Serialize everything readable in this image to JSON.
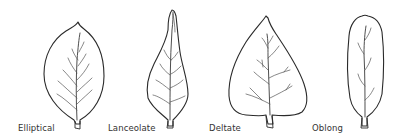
{
  "figure": {
    "leaves": [
      {
        "id": "elliptical",
        "label": "Elliptical"
      },
      {
        "id": "lanceolate",
        "label": "Lanceolate"
      },
      {
        "id": "deltate",
        "label": "Deltate"
      },
      {
        "id": "oblong",
        "label": "Oblong"
      }
    ]
  },
  "colors": {
    "background": "#ffffff",
    "outline": "#2a2a2a",
    "vein": "#555555",
    "label": "#333333"
  }
}
